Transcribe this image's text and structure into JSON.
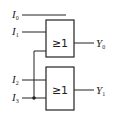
{
  "diagram": {
    "type": "logic-circuit",
    "inputs": [
      {
        "name": "I",
        "sub": "0"
      },
      {
        "name": "I",
        "sub": "1"
      },
      {
        "name": "I",
        "sub": "2"
      },
      {
        "name": "I",
        "sub": "3"
      }
    ],
    "gates": [
      {
        "symbol": "≥1",
        "output": {
          "name": "Y",
          "sub": "0"
        }
      },
      {
        "symbol": "≥1",
        "output": {
          "name": "Y",
          "sub": "1"
        }
      }
    ],
    "colors": {
      "line": "#222222",
      "background": "#ffffff"
    }
  }
}
